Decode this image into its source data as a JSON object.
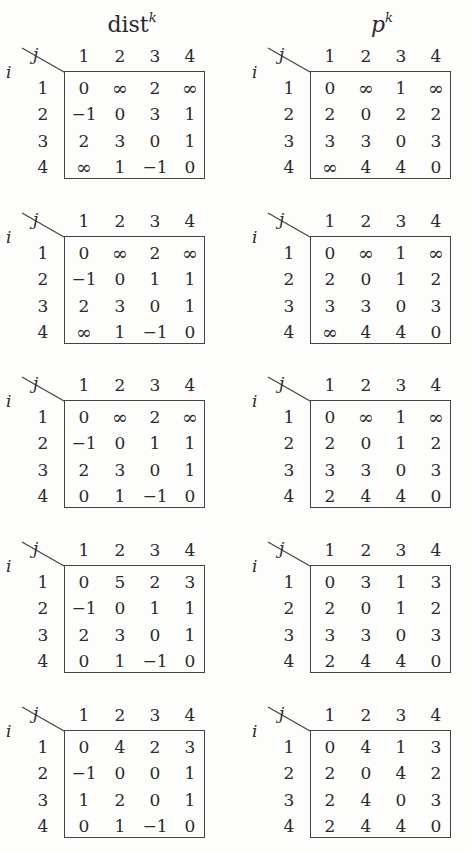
{
  "titles": {
    "dist": {
      "base": "dist",
      "sup": "k"
    },
    "p": {
      "base": "p",
      "sup": "k"
    }
  },
  "axis_labels": {
    "row": "i",
    "col": "j"
  },
  "indices": [
    "1",
    "2",
    "3",
    "4"
  ],
  "blocks": [
    {
      "dist": [
        [
          "0",
          "∞",
          "2",
          "∞"
        ],
        [
          "−1",
          "0",
          "3",
          "1"
        ],
        [
          "2",
          "3",
          "0",
          "1"
        ],
        [
          "∞",
          "1",
          "−1",
          "0"
        ]
      ],
      "p": [
        [
          "0",
          "∞",
          "1",
          "∞"
        ],
        [
          "2",
          "0",
          "2",
          "2"
        ],
        [
          "3",
          "3",
          "0",
          "3"
        ],
        [
          "∞",
          "4",
          "4",
          "0"
        ]
      ]
    },
    {
      "dist": [
        [
          "0",
          "∞",
          "2",
          "∞"
        ],
        [
          "−1",
          "0",
          "1",
          "1"
        ],
        [
          "2",
          "3",
          "0",
          "1"
        ],
        [
          "∞",
          "1",
          "−1",
          "0"
        ]
      ],
      "p": [
        [
          "0",
          "∞",
          "1",
          "∞"
        ],
        [
          "2",
          "0",
          "1",
          "2"
        ],
        [
          "3",
          "3",
          "0",
          "3"
        ],
        [
          "∞",
          "4",
          "4",
          "0"
        ]
      ]
    },
    {
      "dist": [
        [
          "0",
          "∞",
          "2",
          "∞"
        ],
        [
          "−1",
          "0",
          "1",
          "1"
        ],
        [
          "2",
          "3",
          "0",
          "1"
        ],
        [
          "0",
          "1",
          "−1",
          "0"
        ]
      ],
      "p": [
        [
          "0",
          "∞",
          "1",
          "∞"
        ],
        [
          "2",
          "0",
          "1",
          "2"
        ],
        [
          "3",
          "3",
          "0",
          "3"
        ],
        [
          "2",
          "4",
          "4",
          "0"
        ]
      ]
    },
    {
      "dist": [
        [
          "0",
          "5",
          "2",
          "3"
        ],
        [
          "−1",
          "0",
          "1",
          "1"
        ],
        [
          "2",
          "3",
          "0",
          "1"
        ],
        [
          "0",
          "1",
          "−1",
          "0"
        ]
      ],
      "p": [
        [
          "0",
          "3",
          "1",
          "3"
        ],
        [
          "2",
          "0",
          "1",
          "2"
        ],
        [
          "3",
          "3",
          "0",
          "3"
        ],
        [
          "2",
          "4",
          "4",
          "0"
        ]
      ]
    },
    {
      "dist": [
        [
          "0",
          "4",
          "2",
          "3"
        ],
        [
          "−1",
          "0",
          "0",
          "1"
        ],
        [
          "1",
          "2",
          "0",
          "1"
        ],
        [
          "0",
          "1",
          "−1",
          "0"
        ]
      ],
      "p": [
        [
          "0",
          "4",
          "1",
          "3"
        ],
        [
          "2",
          "0",
          "4",
          "2"
        ],
        [
          "2",
          "4",
          "0",
          "3"
        ],
        [
          "2",
          "4",
          "4",
          "0"
        ]
      ]
    }
  ]
}
